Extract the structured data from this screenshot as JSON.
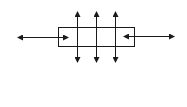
{
  "diagram": {
    "type": "arrow-schematic",
    "stroke_color": "#1a1a1a",
    "background": "#ffffff",
    "box": {
      "x": 58,
      "y": 27,
      "width": 76,
      "height": 19
    },
    "horizontal_arrows": [
      {
        "name": "left-double-arrow",
        "x1": 18,
        "x2": 68,
        "y": 37
      },
      {
        "name": "right-double-arrow",
        "x1": 124,
        "x2": 174,
        "y": 36
      }
    ],
    "vertical_arrows": [
      {
        "name": "vertical-arrow-1",
        "x": 77,
        "y1": 12,
        "y2": 62
      },
      {
        "name": "vertical-arrow-2",
        "x": 96,
        "y1": 12,
        "y2": 62
      },
      {
        "name": "vertical-arrow-3",
        "x": 115,
        "y1": 12,
        "y2": 62
      }
    ]
  }
}
